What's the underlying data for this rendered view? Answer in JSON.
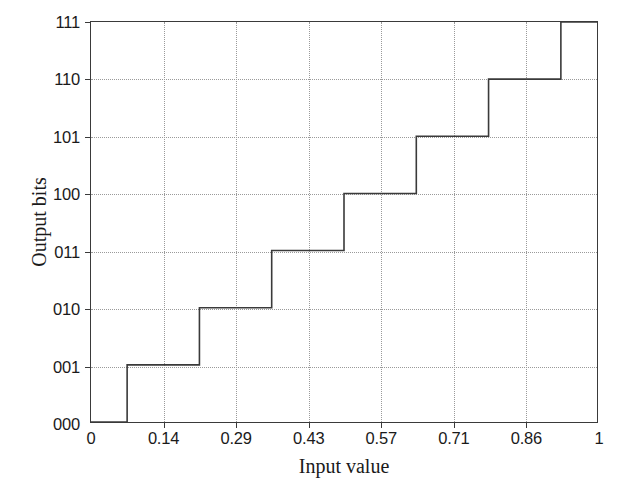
{
  "chart_data": {
    "type": "line",
    "title": "",
    "xlabel": "Input value",
    "ylabel": "Output bits",
    "xlim": [
      0,
      1
    ],
    "ylim": [
      0,
      7
    ],
    "grid": true,
    "legend": null,
    "xticks": [
      0,
      0.14,
      0.29,
      0.43,
      0.57,
      0.71,
      0.86,
      1
    ],
    "xticklabels": [
      "0",
      "0.14",
      "0.29",
      "0.43",
      "0.57",
      "0.71",
      "0.86",
      "1"
    ],
    "yticks": [
      0,
      1,
      2,
      3,
      4,
      5,
      6,
      7
    ],
    "yticklabels": [
      "000",
      "001",
      "010",
      "011",
      "100",
      "101",
      "110",
      "111"
    ],
    "step_transitions": [
      0.0714,
      0.2143,
      0.3571,
      0.5,
      0.6429,
      0.7857,
      0.9286
    ],
    "series": [
      {
        "name": "quantizer",
        "style": "step-post",
        "color": "#3a3a3a",
        "x": [
          0,
          0.0714,
          0.0714,
          0.2143,
          0.2143,
          0.3571,
          0.3571,
          0.5,
          0.5,
          0.6429,
          0.6429,
          0.7857,
          0.7857,
          0.9286,
          0.9286,
          1
        ],
        "y": [
          0,
          0,
          1,
          1,
          2,
          2,
          3,
          3,
          4,
          4,
          5,
          5,
          6,
          6,
          7,
          7
        ],
        "codes": [
          "000",
          "001",
          "010",
          "011",
          "100",
          "101",
          "110",
          "111"
        ]
      }
    ]
  },
  "axis": {
    "x_title": "Input value",
    "y_title": "Output bits"
  },
  "colors": {
    "line": "#3a3a3a",
    "grid": "#9a9a9a",
    "frame": "#3a3a3a",
    "background": "#ffffff"
  }
}
